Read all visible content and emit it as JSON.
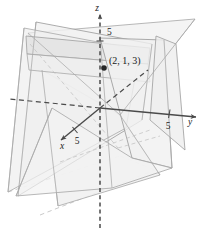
{
  "figure": {
    "type": "3d-coordinate-diagram",
    "background_color": "#ffffff"
  },
  "axes": {
    "x": {
      "label": "x",
      "tick_label": "5",
      "direction": "down-left",
      "arrow": true,
      "solid_from_origin": true
    },
    "y": {
      "label": "y",
      "tick_label": "5",
      "direction": "right",
      "arrow": true,
      "negative_hidden_dashed": true
    },
    "z": {
      "label": "z",
      "tick_label": "5",
      "direction": "up",
      "arrow": true,
      "dashed": true
    }
  },
  "point": {
    "label": "(2, 1, 3)",
    "marker": "filled-dot",
    "coordinates": [
      2,
      1,
      3
    ]
  },
  "colors": {
    "plane_fill": "#f1f1f1",
    "plane_fill_overlap": "#e2e2e2",
    "plane_stroke": "#9a9a9a",
    "axis_stroke": "#4a4a4a",
    "hidden_stroke": "#b4b4b4",
    "text": "#1a1a1a"
  },
  "planes": [
    {
      "name": "plane-left-vertical",
      "shading": "light-gray-translucent"
    },
    {
      "name": "plane-right-vertical",
      "shading": "light-gray-translucent"
    },
    {
      "name": "plane-slanted-rear",
      "shading": "light-gray-translucent"
    }
  ]
}
